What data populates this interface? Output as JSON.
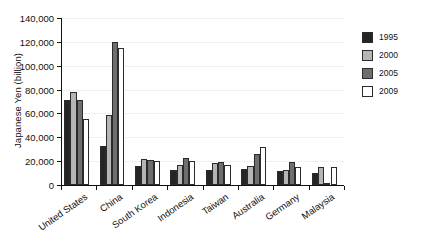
{
  "chart_data": {
    "type": "bar",
    "title": "",
    "subtitle": "",
    "xlabel": "",
    "ylabel": "Japanese Yen (billion)",
    "ylim": [
      0,
      140000
    ],
    "ytick_step": 20000,
    "ytick_labels": [
      "0",
      "20,000",
      "40,000",
      "60,000",
      "80,000",
      "100,000",
      "120,000",
      "140,000"
    ],
    "ytick_values": [
      0,
      20000,
      40000,
      60000,
      80000,
      100000,
      120000,
      140000
    ],
    "grid": true,
    "legend_position": "right",
    "categories": [
      "United States",
      "China",
      "South Korea",
      "Indonesia",
      "Taiwan",
      "Australia",
      "Germany",
      "Malaysia"
    ],
    "series": [
      {
        "name": "1995",
        "color": "#252525",
        "values": [
          71000,
          33000,
          16000,
          13000,
          13000,
          13500,
          12000,
          10000
        ]
      },
      {
        "name": "2000",
        "color": "#b5b5b5",
        "values": [
          78000,
          59000,
          21500,
          17000,
          18500,
          16000,
          13000,
          15000
        ]
      },
      {
        "name": "2005",
        "color": "#6e6e6e",
        "values": [
          71000,
          120000,
          21000,
          22500,
          19500,
          26000,
          19500,
          2000
        ]
      },
      {
        "name": "2009",
        "color": "#ffffff",
        "values": [
          55000,
          114500,
          20500,
          20000,
          16500,
          31500,
          15000,
          15000
        ]
      }
    ]
  },
  "legend": {
    "entries": [
      {
        "label": "1995",
        "key": "y1995"
      },
      {
        "label": "2000",
        "key": "y2000"
      },
      {
        "label": "2005",
        "key": "y2005"
      },
      {
        "label": "2009",
        "key": "y2009"
      }
    ]
  }
}
